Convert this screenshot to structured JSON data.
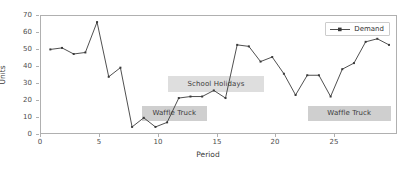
{
  "chart_data": {
    "type": "line",
    "title": "",
    "xlabel": "Period",
    "ylabel": "Units",
    "xlim": [
      -0.8,
      29.6
    ],
    "ylim": [
      -4,
      73
    ],
    "grid": false,
    "legend_position": "upper right",
    "x": [
      0,
      1,
      2,
      3,
      4,
      5,
      6,
      7,
      8,
      9,
      10,
      11,
      12,
      13,
      14,
      15,
      16,
      17,
      18,
      19,
      20,
      21,
      22,
      23,
      24,
      25,
      26,
      27,
      28,
      29
    ],
    "series": [
      {
        "name": "Demand",
        "color": "#3a3a3a",
        "marker": "square",
        "values": [
          51,
          52,
          48,
          49,
          69,
          33,
          39,
          0,
          6,
          0,
          3,
          19,
          20,
          20,
          24,
          19,
          54,
          53,
          43,
          46,
          35,
          21,
          34,
          34,
          20,
          38,
          42,
          56,
          58,
          54
        ]
      }
    ],
    "xticks": [
      0,
      5,
      10,
      15,
      20,
      25
    ],
    "xtick_labels": [
      "0",
      "5",
      "10",
      "15",
      "20",
      "25"
    ],
    "yticks": [
      0,
      10,
      20,
      30,
      40,
      50,
      60,
      70
    ],
    "ytick_labels": [
      "0",
      "10",
      "20",
      "30",
      "40",
      "50",
      "60",
      "70"
    ],
    "annotations": [
      {
        "id": "school-holidays",
        "text": "School Holidays",
        "x_start": 10.0,
        "x_end": 18.2,
        "y": 29
      },
      {
        "id": "waffle-truck-left",
        "text": "Waffle Truck",
        "x_start": 7.8,
        "x_end": 13.3,
        "y": 10
      },
      {
        "id": "waffle-truck-right",
        "text": "Waffle Truck",
        "x_start": 21.9,
        "x_end": 29.0,
        "y": 10
      }
    ]
  },
  "legend": {
    "entries": [
      {
        "label": "Demand"
      }
    ]
  },
  "axis": {
    "x_title": "Period",
    "y_title": "Units"
  }
}
